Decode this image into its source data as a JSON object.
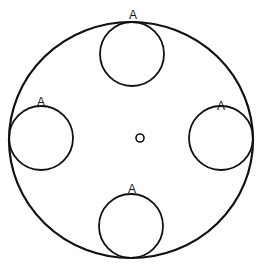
{
  "diagram": {
    "stroke_color": "#111111",
    "background": "#ffffff",
    "outer_circle": {
      "cx": 131,
      "cy": 140,
      "rx": 122,
      "ry": 118
    },
    "center_mark": {
      "cx": 140,
      "cy": 138,
      "r": 4
    },
    "small_circles": [
      {
        "position": "top",
        "cx": 132,
        "cy": 54,
        "r": 32,
        "label": "A",
        "label_x": 133,
        "label_y": 19
      },
      {
        "position": "left",
        "cx": 41,
        "cy": 138,
        "r": 32,
        "label": "A",
        "label_x": 41,
        "label_y": 106
      },
      {
        "position": "right",
        "cx": 221,
        "cy": 138,
        "r": 32,
        "label": "A",
        "label_x": 221,
        "label_y": 110
      },
      {
        "position": "bottom",
        "cx": 131,
        "cy": 226,
        "r": 32,
        "label": "A",
        "label_x": 132,
        "label_y": 193
      }
    ]
  }
}
